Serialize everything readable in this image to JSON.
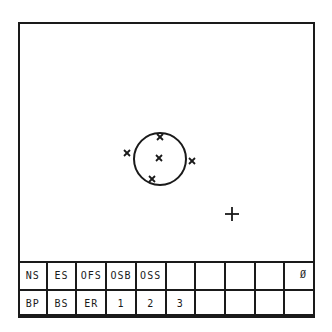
{
  "canvas": {
    "circle": {
      "cx": 140,
      "cy": 135,
      "r": 26
    },
    "markers_x": [
      {
        "x": 140,
        "y": 113
      },
      {
        "x": 107,
        "y": 129
      },
      {
        "x": 139,
        "y": 134
      },
      {
        "x": 172,
        "y": 137
      },
      {
        "x": 132,
        "y": 155
      }
    ],
    "cursor_plus": {
      "x": 212,
      "y": 190
    }
  },
  "toolbar": {
    "row1": [
      "NS",
      "ES",
      "OFS",
      "OSB",
      "OSS",
      "",
      "",
      "",
      "",
      "Ø"
    ],
    "row2": [
      "BP",
      "BS",
      "ER",
      "1",
      "2",
      "3",
      "",
      "",
      "",
      ""
    ]
  }
}
